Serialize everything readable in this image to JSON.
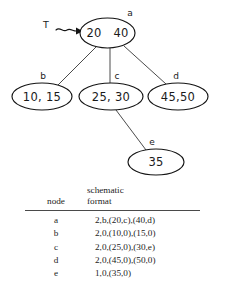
{
  "diagram": {
    "pointer": {
      "label": "T",
      "icon": "squiggly-arrow-icon"
    },
    "nodes": [
      {
        "id": "a",
        "label": "a",
        "keys": [
          "20",
          "40"
        ],
        "text": "20  40"
      },
      {
        "id": "b",
        "label": "b",
        "keys": [
          "10",
          "15"
        ],
        "text": "10, 15"
      },
      {
        "id": "c",
        "label": "c",
        "keys": [
          "25",
          "30"
        ],
        "text": "25, 30"
      },
      {
        "id": "d",
        "label": "d",
        "keys": [
          "45",
          "50"
        ],
        "text": "45,50"
      },
      {
        "id": "e",
        "label": "e",
        "keys": [
          "35"
        ],
        "text": "35"
      }
    ],
    "edges": [
      {
        "from": "a",
        "to": "b"
      },
      {
        "from": "a",
        "to": "c"
      },
      {
        "from": "a",
        "to": "d"
      },
      {
        "from": "c",
        "to": "e"
      }
    ]
  },
  "table": {
    "headers": {
      "node": "node",
      "format_line1": "schematic",
      "format_line2": "format"
    },
    "rows": [
      {
        "node": "a",
        "format": "2,b,(20,c),(40,d)"
      },
      {
        "node": "b",
        "format": "2,0,(10,0),(15,0)"
      },
      {
        "node": "c",
        "format": "2,0,(25,0),(30,e)"
      },
      {
        "node": "d",
        "format": "2,0,(45,0),(50,0)"
      },
      {
        "node": "e",
        "format": "1,0,(35,0)"
      }
    ]
  },
  "colors": {
    "ink": "#141414",
    "edge": "#2b2b2b",
    "rule": "#4a4a4a",
    "background": "#ffffff"
  }
}
